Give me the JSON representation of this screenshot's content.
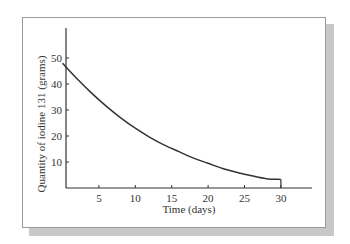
{
  "chart_data": {
    "type": "line",
    "title": "",
    "xlabel": "Time (days)",
    "ylabel": "Quantity of iodine 131 (grams)",
    "xlim": [
      0,
      34
    ],
    "ylim": [
      0,
      60
    ],
    "x_ticks": [
      5,
      10,
      15,
      20,
      25,
      30
    ],
    "y_ticks": [
      10,
      20,
      30,
      40,
      50
    ],
    "grid": false,
    "legend": "none",
    "series": [
      {
        "name": "Iodine 131 remaining",
        "color": "#333333",
        "x": [
          0,
          2,
          4,
          6,
          8,
          10,
          12,
          14,
          16,
          18,
          20,
          22,
          24,
          26,
          28,
          30
        ],
        "y": [
          48,
          42,
          36.5,
          31.5,
          27,
          23,
          19.5,
          16.5,
          14,
          11.5,
          9.5,
          7.5,
          6,
          4.7,
          3.6,
          3.3
        ]
      }
    ],
    "annotations": [
      {
        "text": "endpoint marker at day 30",
        "x": 30,
        "y": 3.3
      }
    ]
  }
}
